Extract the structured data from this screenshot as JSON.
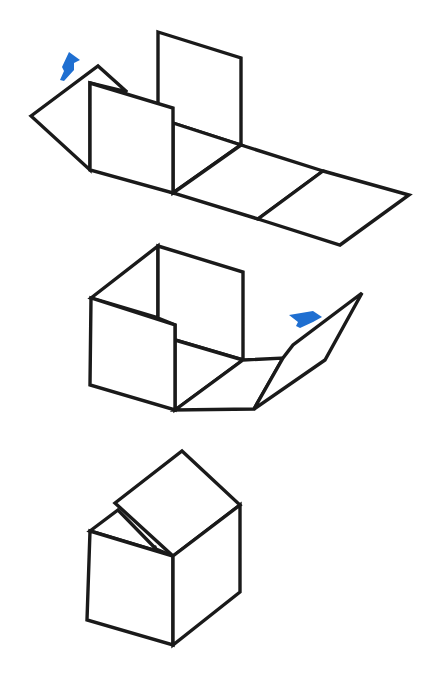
{
  "diagram": {
    "title": "",
    "colors": {
      "line": "#1a1a1a",
      "arrow": "#1f6fd1",
      "background": "#ffffff"
    },
    "stages": [
      {
        "id": 1,
        "label": "",
        "description": "Cube net laid flat with two side faces raised and left flap folding up"
      },
      {
        "id": 2,
        "label": "",
        "description": "Partially folded box with right flap rotating inward"
      },
      {
        "id": 3,
        "label": "",
        "description": "Nearly closed cube with lid resting on top"
      }
    ],
    "arrows": [
      {
        "stage": 1,
        "direction": "up",
        "meaning": "fold-up"
      },
      {
        "stage": 2,
        "direction": "up-left",
        "meaning": "fold-inward"
      }
    ]
  }
}
